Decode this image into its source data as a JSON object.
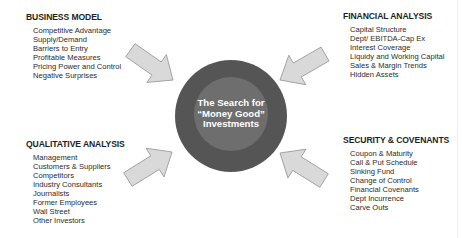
{
  "center": {
    "lines": [
      "The Search for",
      "“Money Good”",
      "Investments"
    ],
    "outer_color": "#555555",
    "inner_color": "#6e6e6e"
  },
  "arrow_color": {
    "fill": "#d9d9d9",
    "stroke": "#9a9a9a"
  },
  "business_model": {
    "title": "BUSINESS MODEL",
    "items": [
      "Competitive Advantage",
      "Supply/Demand",
      "Barriers to Entry",
      "Profitable Measures",
      "Pricing Power and Control",
      "Negative Surprises"
    ]
  },
  "financial_analysis": {
    "title": "FINANCIAL ANALYSIS",
    "items": [
      "Capital Structure",
      "Dept/ EBITDA-Cap Ex",
      "Interest Coverage",
      "Liquidy and Working Capital",
      "Sales & Margin Trends",
      "Hidden Assets"
    ]
  },
  "qualitative_analysis": {
    "title": "QUALITATIVE ANALYSIS",
    "items": [
      "Management",
      "Customers & Suppliers",
      "Competitors",
      "Industry Consultants",
      "Journalists",
      "Former Employees",
      "Wall Street",
      "Other Investors"
    ]
  },
  "security_covenants": {
    "title": "SECURITY & COVENANTS",
    "items": [
      "Coupon & Maturity",
      "Call & Put Schedule",
      "Sinking Fund",
      "Change of Control",
      "Financial Covenants",
      "Dept Incurrence",
      "Carve Outs"
    ]
  }
}
